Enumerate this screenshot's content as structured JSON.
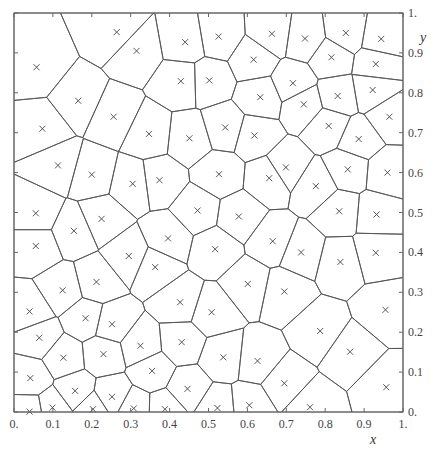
{
  "chart_data": {
    "type": "scatter",
    "subtype": "voronoi",
    "title": "",
    "xlabel": "x",
    "ylabel": "y",
    "xlim": [
      0,
      1
    ],
    "ylim": [
      0,
      1
    ],
    "grid": false,
    "x_ticks": [
      "0.",
      "0.1",
      "0.2",
      "0.3",
      "0.4",
      "0.5",
      "0.6",
      "0.7",
      "0.8",
      "0.9",
      "1."
    ],
    "y_ticks": [
      "0.",
      "0.1",
      "0.2",
      "0.3",
      "0.4",
      "0.5",
      "0.6",
      "0.7",
      "0.8",
      "0.9",
      "1."
    ],
    "marker": "x",
    "line_color": "#555555",
    "marker_color": "#444444",
    "points": [
      [
        0.264,
        0.952
      ],
      [
        0.315,
        0.905
      ],
      [
        0.44,
        0.927
      ],
      [
        0.526,
        0.941
      ],
      [
        0.663,
        0.948
      ],
      [
        0.748,
        0.936
      ],
      [
        0.853,
        0.95
      ],
      [
        0.944,
        0.935
      ],
      [
        0.058,
        0.864
      ],
      [
        0.616,
        0.883
      ],
      [
        0.816,
        0.889
      ],
      [
        0.93,
        0.872
      ],
      [
        0.429,
        0.829
      ],
      [
        0.502,
        0.831
      ],
      [
        0.717,
        0.824
      ],
      [
        0.165,
        0.78
      ],
      [
        0.633,
        0.789
      ],
      [
        0.745,
        0.771
      ],
      [
        0.832,
        0.792
      ],
      [
        0.922,
        0.807
      ],
      [
        0.256,
        0.74
      ],
      [
        0.965,
        0.74
      ],
      [
        0.073,
        0.71
      ],
      [
        0.347,
        0.697
      ],
      [
        0.451,
        0.686
      ],
      [
        0.543,
        0.713
      ],
      [
        0.618,
        0.693
      ],
      [
        0.809,
        0.717
      ],
      [
        0.886,
        0.684
      ],
      [
        0.113,
        0.618
      ],
      [
        0.2,
        0.595
      ],
      [
        0.305,
        0.572
      ],
      [
        0.374,
        0.581
      ],
      [
        0.527,
        0.596
      ],
      [
        0.699,
        0.613
      ],
      [
        0.656,
        0.586
      ],
      [
        0.776,
        0.566
      ],
      [
        0.858,
        0.608
      ],
      [
        0.96,
        0.6
      ],
      [
        0.056,
        0.498
      ],
      [
        0.154,
        0.454
      ],
      [
        0.225,
        0.484
      ],
      [
        0.472,
        0.505
      ],
      [
        0.578,
        0.49
      ],
      [
        0.836,
        0.503
      ],
      [
        0.932,
        0.495
      ],
      [
        0.056,
        0.416
      ],
      [
        0.396,
        0.435
      ],
      [
        0.517,
        0.408
      ],
      [
        0.665,
        0.428
      ],
      [
        0.738,
        0.4
      ],
      [
        0.295,
        0.391
      ],
      [
        0.363,
        0.363
      ],
      [
        0.839,
        0.376
      ],
      [
        0.93,
        0.399
      ],
      [
        0.125,
        0.305
      ],
      [
        0.212,
        0.326
      ],
      [
        0.601,
        0.321
      ],
      [
        0.695,
        0.302
      ],
      [
        0.04,
        0.252
      ],
      [
        0.427,
        0.275
      ],
      [
        0.508,
        0.25
      ],
      [
        0.184,
        0.235
      ],
      [
        0.252,
        0.22
      ],
      [
        0.955,
        0.256
      ],
      [
        0.065,
        0.186
      ],
      [
        0.787,
        0.203
      ],
      [
        0.431,
        0.175
      ],
      [
        0.325,
        0.166
      ],
      [
        0.127,
        0.136
      ],
      [
        0.23,
        0.145
      ],
      [
        0.538,
        0.137
      ],
      [
        0.626,
        0.128
      ],
      [
        0.864,
        0.151
      ],
      [
        0.042,
        0.085
      ],
      [
        0.355,
        0.103
      ],
      [
        0.695,
        0.072
      ],
      [
        0.446,
        0.058
      ],
      [
        0.157,
        0.053
      ],
      [
        0.252,
        0.038
      ],
      [
        0.957,
        0.062
      ],
      [
        0.04,
        0.001
      ],
      [
        0.099,
        0.011
      ],
      [
        0.203,
        0.007
      ],
      [
        0.308,
        0.009
      ],
      [
        0.388,
        0.007
      ],
      [
        0.523,
        0.01
      ],
      [
        0.605,
        0.017
      ],
      [
        0.761,
        0.012
      ]
    ]
  }
}
